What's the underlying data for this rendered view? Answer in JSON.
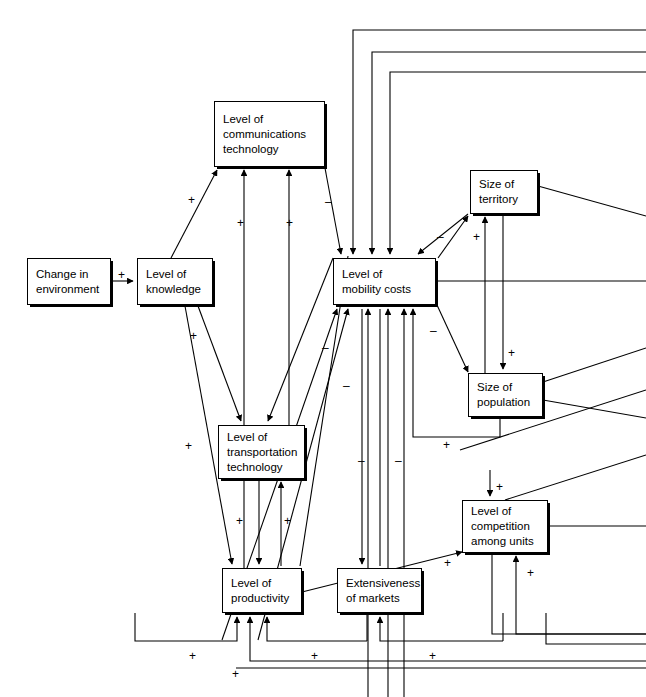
{
  "diagram": {
    "type": "causal-loop-diagram",
    "width": 646,
    "height": 697,
    "background_color": "#ffffff",
    "line_color": "#000000",
    "box_border_color": "#000000",
    "nodes": [
      {
        "id": "change-in-environment",
        "label": "Change in\nenvironment",
        "x": 27,
        "y": 258,
        "w": 84,
        "h": 47
      },
      {
        "id": "level-of-knowledge",
        "label": "Level of\nknowledge",
        "x": 137,
        "y": 258,
        "w": 76,
        "h": 47
      },
      {
        "id": "level-of-communications-technology",
        "label": "Level of\ncommunications\ntechnology",
        "x": 214,
        "y": 101,
        "w": 111,
        "h": 66
      },
      {
        "id": "level-of-mobility-costs",
        "label": "Level of\nmobility costs",
        "x": 333,
        "y": 258,
        "w": 103,
        "h": 47
      },
      {
        "id": "size-of-territory",
        "label": "Size of\nterritory",
        "x": 470,
        "y": 170,
        "w": 68,
        "h": 44
      },
      {
        "id": "size-of-population",
        "label": "Size of\npopulation",
        "x": 468,
        "y": 373,
        "w": 75,
        "h": 44
      },
      {
        "id": "level-of-transportation-technology",
        "label": "Level of\ntransportation\ntechnology",
        "x": 218,
        "y": 425,
        "w": 87,
        "h": 54
      },
      {
        "id": "level-of-competition-among-units",
        "label": "Level of\ncompetition\namong units",
        "x": 462,
        "y": 500,
        "w": 86,
        "h": 53
      },
      {
        "id": "level-of-productivity",
        "label": "Level of\nproductivity",
        "x": 222,
        "y": 568,
        "w": 80,
        "h": 45
      },
      {
        "id": "extensiveness-of-markets",
        "label": "Extensiveness\nof markets",
        "x": 337,
        "y": 568,
        "w": 85,
        "h": 45
      }
    ],
    "signs": [
      {
        "id": "sign-env-to-knowledge",
        "label": "+",
        "x": 118,
        "y": 269
      },
      {
        "id": "sign-knowledge-to-comm-tech",
        "label": "+",
        "x": 188,
        "y": 194
      },
      {
        "id": "sign-prod-to-comm-tech",
        "label": "+",
        "x": 237,
        "y": 217
      },
      {
        "id": "sign-transport-to-comm-tech",
        "label": "+",
        "x": 286,
        "y": 217
      },
      {
        "id": "sign-comm-tech-to-mobility",
        "label": "–",
        "x": 325,
        "y": 196
      },
      {
        "id": "sign-knowledge-to-transport",
        "label": "+",
        "x": 190,
        "y": 330
      },
      {
        "id": "sign-knowledge-to-productivity",
        "label": "+",
        "x": 185,
        "y": 440
      },
      {
        "id": "sign-transport-to-productivity",
        "label": "+",
        "x": 236,
        "y": 515
      },
      {
        "id": "sign-prod-to-transport",
        "label": "+",
        "x": 284,
        "y": 515
      },
      {
        "id": "sign-mobility-to-territory",
        "label": "–",
        "x": 437,
        "y": 231
      },
      {
        "id": "sign-population-to-territory",
        "label": "+",
        "x": 473,
        "y": 231
      },
      {
        "id": "sign-mobility-to-population",
        "label": "–",
        "x": 430,
        "y": 325
      },
      {
        "id": "sign-territory-to-population",
        "label": "+",
        "x": 508,
        "y": 347
      },
      {
        "id": "sign-population-to-mobility",
        "label": "+",
        "x": 443,
        "y": 439
      },
      {
        "id": "sign-to-competition-top",
        "label": "+",
        "x": 496,
        "y": 481
      },
      {
        "id": "sign-competition-from-productivity",
        "label": "+",
        "x": 444,
        "y": 557
      },
      {
        "id": "sign-competition-bottom",
        "label": "+",
        "x": 527,
        "y": 567
      },
      {
        "id": "sign-mobility-neg-a",
        "label": "–",
        "x": 322,
        "y": 342
      },
      {
        "id": "sign-mobility-neg-b",
        "label": "–",
        "x": 343,
        "y": 380
      },
      {
        "id": "sign-mobility-neg-c",
        "label": "–",
        "x": 358,
        "y": 455
      },
      {
        "id": "sign-mobility-neg-d",
        "label": "–",
        "x": 395,
        "y": 455
      },
      {
        "id": "sign-feedback-left",
        "label": "+",
        "x": 189,
        "y": 650
      },
      {
        "id": "sign-feedback-mid",
        "label": "+",
        "x": 311,
        "y": 650
      },
      {
        "id": "sign-feedback-right",
        "label": "+",
        "x": 429,
        "y": 650
      },
      {
        "id": "sign-feedback-bottom",
        "label": "+",
        "x": 232,
        "y": 668
      }
    ]
  }
}
